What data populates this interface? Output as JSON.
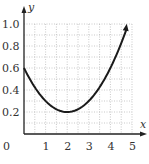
{
  "chart_data": {
    "type": "line",
    "title": "",
    "xlabel": "x",
    "ylabel": "y",
    "xlim": [
      0,
      5
    ],
    "ylim": [
      0,
      1.0
    ],
    "x_ticks": [
      "0",
      "1",
      "2",
      "3",
      "4",
      "5"
    ],
    "y_ticks": [
      "0.2",
      "0.4",
      "0.6",
      "0.8",
      "1.0"
    ],
    "grid": true,
    "grid_style": "dotted",
    "grid_x_step": 0.5,
    "grid_y_step": 0.1,
    "series": [
      {
        "name": "curve",
        "description": "parabola opening upward, arrow at right end",
        "x": [
          0,
          0.5,
          1,
          1.5,
          2,
          2.5,
          3,
          3.5,
          4,
          4.5,
          4.75
        ],
        "values": [
          0.6,
          0.425,
          0.3,
          0.225,
          0.2,
          0.225,
          0.3,
          0.425,
          0.6,
          0.825,
          0.956
        ],
        "arrow_end": true
      }
    ],
    "legend": null
  },
  "labels": {
    "x_axis": "x",
    "y_axis": "y",
    "origin": "0"
  }
}
